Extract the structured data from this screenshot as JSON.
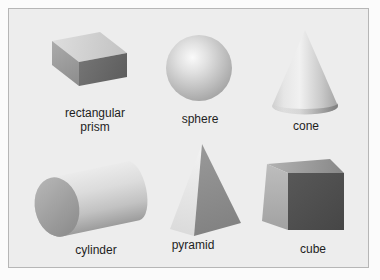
{
  "panel": {
    "page_background": "#fbfbfb",
    "background": "#ededed",
    "border_color": "#b6b6b6"
  },
  "figures": [
    {
      "name": "rectangular prism",
      "lines": [
        "rectangular",
        "prism"
      ],
      "colors": {
        "top_face": "#d0d0d0",
        "end_face": "#9a9a9a",
        "front_face": "#666666"
      }
    },
    {
      "name": "sphere",
      "lines": [
        "sphere"
      ],
      "colors": {
        "highlight": "#fafafa",
        "edge": "#999999"
      }
    },
    {
      "name": "cone",
      "lines": [
        "cone"
      ],
      "colors": {
        "light_side": "#f1f1f1",
        "shaded_side": "#a2a2a2"
      }
    },
    {
      "name": "cylinder",
      "lines": [
        "cylinder"
      ],
      "colors": {
        "body_light": "#ebebeb",
        "body_dark": "#9c9c9c",
        "end_cap": "#a0a0a0"
      }
    },
    {
      "name": "pyramid",
      "lines": [
        "pyramid"
      ],
      "colors": {
        "left_face": "#ededed",
        "right_face": "#8a8a8a"
      }
    },
    {
      "name": "cube",
      "lines": [
        "cube"
      ],
      "colors": {
        "top_face": "#9e9e9e",
        "left_face": "#b0b0b0",
        "front_face": "#4f4f4f"
      }
    }
  ]
}
